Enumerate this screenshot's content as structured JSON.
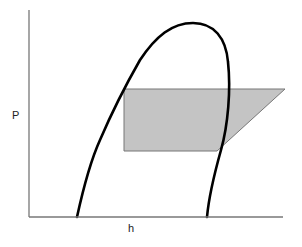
{
  "diagram": {
    "type": "pressure-enthalpy diagram",
    "axes": {
      "y_label": "P",
      "x_label": "h"
    },
    "elements": [
      {
        "name": "saturation-dome",
        "description": "bell-shaped saturation curve"
      },
      {
        "name": "cycle-region",
        "description": "gray shaded cycle polygon"
      }
    ],
    "colors": {
      "axis": "#777777",
      "curve": "#000000",
      "cycle_fill": "#c4c4c4",
      "cycle_stroke": "#777777",
      "background": "#ffffff"
    }
  }
}
